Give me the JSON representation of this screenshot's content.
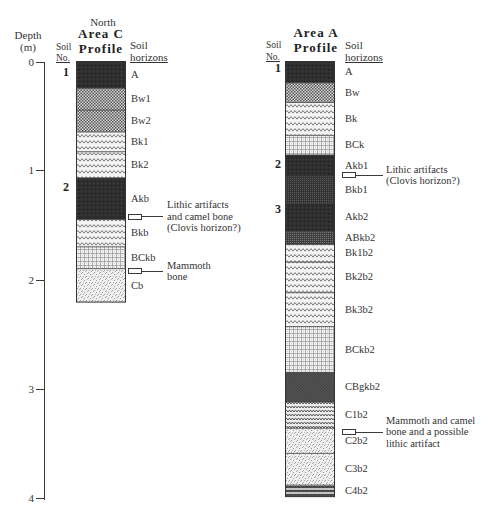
{
  "depth_axis": {
    "title_line1": "Depth",
    "title_line2": "(m)",
    "ticks": [
      "0",
      "1",
      "2",
      "3",
      "4"
    ]
  },
  "profiles": [
    {
      "over_title": "North",
      "title_line1": "Area C",
      "title_line2": "Profile",
      "soil_no_header": [
        "Soil",
        "No."
      ],
      "horizons_header": [
        "Soil",
        "horizons"
      ],
      "soil_numbers": [
        {
          "label": "1",
          "depth": 0.1
        },
        {
          "label": "2",
          "depth": 1.15
        }
      ],
      "horizons": [
        {
          "name": "A",
          "top": 0.0,
          "bottom": 0.25,
          "pattern": "dark"
        },
        {
          "name": "Bw1",
          "top": 0.25,
          "bottom": 0.45,
          "pattern": "checker"
        },
        {
          "name": "Bw2",
          "top": 0.45,
          "bottom": 0.65,
          "pattern": "checker"
        },
        {
          "name": "Bk1",
          "top": 0.65,
          "bottom": 0.83,
          "pattern": "wavy"
        },
        {
          "name": "Bk2",
          "top": 0.83,
          "bottom": 1.07,
          "pattern": "wavy"
        },
        {
          "name": "Akb",
          "top": 1.07,
          "bottom": 1.45,
          "pattern": "dark"
        },
        {
          "name": "Bkb",
          "top": 1.45,
          "bottom": 1.7,
          "pattern": "wavy"
        },
        {
          "name": "BCkb",
          "top": 1.7,
          "bottom": 1.9,
          "pattern": "grid"
        },
        {
          "name": "Cb",
          "top": 1.9,
          "bottom": 2.21,
          "pattern": "stipple"
        }
      ],
      "annotations": [
        {
          "depth": 1.42,
          "lines": [
            "Lithic artifacts",
            "and camel bone",
            "(Clovis horizon?)"
          ]
        },
        {
          "depth": 1.92,
          "lines": [
            "Mammoth",
            "bone"
          ]
        }
      ]
    },
    {
      "over_title": "",
      "title_line1": "Area A",
      "title_line2": "Profile",
      "soil_no_header": [
        "Soil",
        "No."
      ],
      "horizons_header": [
        "Soil",
        "horizons"
      ],
      "soil_numbers": [
        {
          "label": "1",
          "depth": 0.06
        },
        {
          "label": "2",
          "depth": 0.94
        },
        {
          "label": "3",
          "depth": 1.35
        }
      ],
      "horizons": [
        {
          "name": "A",
          "top": 0.0,
          "bottom": 0.2,
          "pattern": "dark"
        },
        {
          "name": "Bw",
          "top": 0.2,
          "bottom": 0.38,
          "pattern": "checker"
        },
        {
          "name": "Bk",
          "top": 0.38,
          "bottom": 0.68,
          "pattern": "wavy"
        },
        {
          "name": "BCk",
          "top": 0.68,
          "bottom": 0.86,
          "pattern": "grid"
        },
        {
          "name": "Akb1",
          "top": 0.86,
          "bottom": 1.06,
          "pattern": "dark"
        },
        {
          "name": "Bkb1",
          "top": 1.06,
          "bottom": 1.3,
          "pattern": "darkgrid"
        },
        {
          "name": "Akb2",
          "top": 1.3,
          "bottom": 1.56,
          "pattern": "dark"
        },
        {
          "name": "ABkb2",
          "top": 1.56,
          "bottom": 1.68,
          "pattern": "darkdots"
        },
        {
          "name": "Bk1b2",
          "top": 1.68,
          "bottom": 1.84,
          "pattern": "wavy"
        },
        {
          "name": "Bk2b2",
          "top": 1.84,
          "bottom": 2.12,
          "pattern": "wavy"
        },
        {
          "name": "Bk3b2",
          "top": 2.12,
          "bottom": 2.43,
          "pattern": "wavy"
        },
        {
          "name": "BCkb2",
          "top": 2.43,
          "bottom": 2.85,
          "pattern": "grid"
        },
        {
          "name": "CBgkb2",
          "top": 2.85,
          "bottom": 3.12,
          "pattern": "crosshatch"
        },
        {
          "name": "C1b2",
          "top": 3.12,
          "bottom": 3.36,
          "pattern": "densewavy"
        },
        {
          "name": "C2b2",
          "top": 3.36,
          "bottom": 3.59,
          "pattern": "stipple"
        },
        {
          "name": "C3b2",
          "top": 3.59,
          "bottom": 3.88,
          "pattern": "stipple"
        },
        {
          "name": "C4b2",
          "top": 3.88,
          "bottom": 3.99,
          "pattern": "zigdark"
        }
      ],
      "annotations": [
        {
          "depth": 1.04,
          "lines": [
            "Lithic artifacts",
            "(Clovis horizon?)"
          ]
        },
        {
          "depth": 3.39,
          "lines": [
            "Mammoth and camel",
            "bone and a possible",
            "lithic artifact"
          ]
        }
      ]
    }
  ]
}
